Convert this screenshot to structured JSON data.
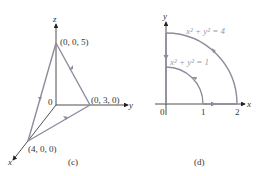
{
  "figure_c": {
    "caption": "(c)",
    "axes": {
      "x": "x",
      "y": "y",
      "z": "z",
      "origin": "0"
    },
    "points": [
      {
        "label": "(0, 0, 5)"
      },
      {
        "label": "(0, 3, 0)"
      },
      {
        "label": "(4, 0, 0)"
      }
    ]
  },
  "figure_d": {
    "caption": "(d)",
    "axes": {
      "x": "x",
      "y": "y",
      "origin": "0"
    },
    "ticks": [
      "1",
      "2"
    ],
    "curves": [
      {
        "label": "x² + y² = 4",
        "radius": 2
      },
      {
        "label": "x² + y² = 1",
        "radius": 1
      }
    ]
  },
  "colors": {
    "path": "#8c8c9c",
    "axis": "#222222",
    "equation": "#9a9aa6"
  }
}
